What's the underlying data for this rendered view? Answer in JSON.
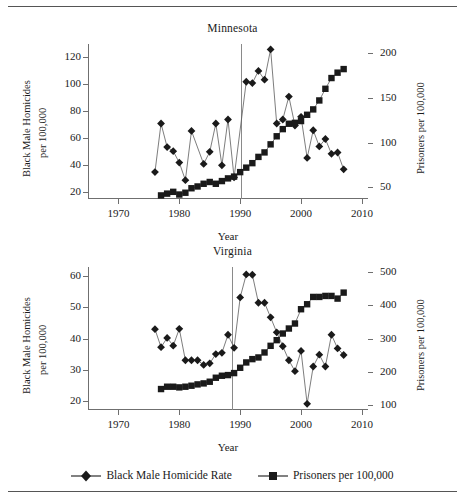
{
  "figure": {
    "legend": [
      {
        "marker": "diamond",
        "label": "Black Male Homicide Rate"
      },
      {
        "marker": "square",
        "label": "Prisoners per 100,000"
      }
    ],
    "colors": {
      "ink": "#1a1a1a",
      "axis": "#6f6f6f",
      "rule": "#555555",
      "vline": "#8a8a8a"
    }
  },
  "chart_data": [
    {
      "type": "line",
      "title": "Minnesota",
      "xlabel": "Year",
      "ylabel": "Black Male Homicides per 100,000",
      "y2label": "Prisoners per 100,000",
      "xlim": [
        1965,
        2011
      ],
      "xticks": [
        1970,
        1980,
        1990,
        2000,
        2010
      ],
      "ylim": [
        15,
        130
      ],
      "yticks": [
        20,
        40,
        60,
        80,
        100,
        120
      ],
      "y2lim": [
        37,
        210
      ],
      "y2ticks": [
        50,
        100,
        150,
        200
      ],
      "grid": false,
      "legend_position": "bottom-figure",
      "annotations": [
        {
          "type": "vline",
          "x": 1990.2,
          "label": ""
        }
      ],
      "series": [
        {
          "name": "Black Male Homicide Rate",
          "axis": "left",
          "marker": "diamond",
          "x": [
            1976,
            1977,
            1978,
            1979,
            1980,
            1981,
            1982,
            1984,
            1985,
            1986,
            1987,
            1988,
            1989,
            1991,
            1992,
            1993,
            1994,
            1995,
            1996,
            1997,
            1998,
            1999,
            2000,
            2001,
            2002,
            2003,
            2004,
            2005,
            2006,
            2007
          ],
          "values": [
            35,
            71,
            53.5,
            50.5,
            42,
            29,
            65.5,
            41,
            50,
            71,
            40,
            74,
            31,
            102,
            101,
            110,
            103.5,
            126,
            71,
            74,
            91,
            69.5,
            76,
            45.5,
            66,
            54,
            59.5,
            48.5,
            49.5,
            37
          ]
        },
        {
          "name": "Prisoners per 100,000",
          "axis": "right",
          "marker": "square",
          "x": [
            1977,
            1978,
            1979,
            1980,
            1981,
            1982,
            1983,
            1984,
            1985,
            1986,
            1987,
            1988,
            1989,
            1990,
            1991,
            1992,
            1993,
            1994,
            1995,
            1996,
            1997,
            1998,
            1999,
            2000,
            2001,
            2002,
            2003,
            2004,
            2005,
            2006,
            2007
          ],
          "values": [
            41,
            43,
            45,
            42,
            44,
            49,
            51,
            54,
            56,
            54,
            57,
            60,
            62,
            67,
            72,
            77,
            84,
            89,
            98,
            107,
            115,
            121,
            122,
            124,
            131,
            137,
            147,
            160,
            172,
            178,
            182
          ]
        }
      ]
    },
    {
      "type": "line",
      "title": "Virginia",
      "xlabel": "Year",
      "ylabel": "Black Male Homicides per 100,000",
      "y2label": "Prisoners per 100,000",
      "xlim": [
        1965,
        2011
      ],
      "xticks": [
        1970,
        1980,
        1990,
        2000,
        2010
      ],
      "ylim": [
        17,
        63
      ],
      "yticks": [
        20,
        30,
        40,
        50,
        60
      ],
      "y2lim": [
        85,
        515
      ],
      "y2ticks": [
        100,
        200,
        300,
        400,
        500
      ],
      "grid": false,
      "legend_position": "bottom-figure",
      "annotations": [
        {
          "type": "vline",
          "x": 1988.7,
          "label": ""
        }
      ],
      "series": [
        {
          "name": "Black Male Homicide Rate",
          "axis": "left",
          "marker": "diamond",
          "x": [
            1976,
            1977,
            1978,
            1979,
            1980,
            1981,
            1982,
            1983,
            1984,
            1985,
            1986,
            1987,
            1988,
            1989,
            1990,
            1991,
            1992,
            1993,
            1994,
            1995,
            1996,
            1997,
            1998,
            1999,
            2000,
            2001,
            2002,
            2003,
            2004,
            2005,
            2006,
            2007
          ],
          "values": [
            43,
            37.2,
            40.2,
            37.7,
            43.1,
            33,
            33,
            33,
            31.5,
            32,
            35,
            35.4,
            41.2,
            37,
            53.2,
            60.6,
            60.5,
            51.5,
            51.5,
            46.8,
            42,
            37.5,
            33,
            29.5,
            36,
            19,
            31,
            34.8,
            31,
            41.2,
            36.8,
            34.7
          ]
        },
        {
          "name": "Prisoners per 100,000",
          "axis": "right",
          "marker": "square",
          "x": [
            1977,
            1978,
            1979,
            1980,
            1981,
            1982,
            1983,
            1984,
            1985,
            1986,
            1987,
            1988,
            1989,
            1990,
            1991,
            1992,
            1993,
            1994,
            1995,
            1996,
            1997,
            1998,
            1999,
            2000,
            2001,
            2002,
            2003,
            2004,
            2005,
            2006,
            2007
          ],
          "values": [
            148,
            155,
            155,
            153,
            155,
            158,
            162,
            165,
            170,
            182,
            188,
            190,
            196,
            212,
            228,
            238,
            243,
            258,
            278,
            295,
            315,
            330,
            345,
            388,
            403,
            425,
            425,
            428,
            428,
            420,
            438
          ]
        }
      ]
    }
  ]
}
